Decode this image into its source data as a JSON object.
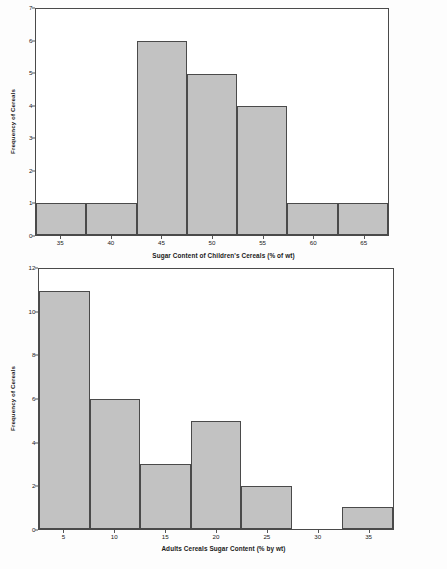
{
  "chart_data": [
    {
      "id": "childrens-cereals-histogram",
      "type": "bar",
      "title": "",
      "xlabel": "Sugar Content of Children's Cereals (% of wt)",
      "ylabel": "Frequency of Cereals",
      "categories": [
        "35",
        "40",
        "45",
        "50",
        "55",
        "60",
        "65"
      ],
      "values": [
        1,
        1,
        6,
        5,
        4,
        1,
        1
      ],
      "xlim": [
        32.5,
        67.5
      ],
      "ylim": [
        0,
        7
      ],
      "yticks": [
        "7",
        "6",
        "5",
        "4",
        "3",
        "2",
        "1",
        "0"
      ],
      "ytick_values": [
        7,
        6,
        5,
        4,
        3,
        2,
        1,
        0
      ],
      "grid": false,
      "legend": false,
      "bar_fill": "#c2c2c2",
      "bar_edge": "#4a4a4a"
    },
    {
      "id": "adults-cereals-histogram",
      "type": "bar",
      "title": "",
      "xlabel": "Adults Cereals Sugar Content (% by wt)",
      "ylabel": "Frequency of Cereals",
      "categories": [
        "5",
        "10",
        "15",
        "20",
        "25",
        "30",
        "35"
      ],
      "values": [
        11,
        6,
        3,
        5,
        2,
        0,
        1
      ],
      "xlim": [
        2.5,
        37.5
      ],
      "ylim": [
        0,
        12
      ],
      "yticks": [
        "12",
        "10",
        "8",
        "6",
        "4",
        "2",
        "0"
      ],
      "ytick_values": [
        12,
        10,
        8,
        6,
        4,
        2,
        0
      ],
      "grid": false,
      "legend": false,
      "bar_fill": "#c2c2c2",
      "bar_edge": "#4a4a4a"
    }
  ]
}
